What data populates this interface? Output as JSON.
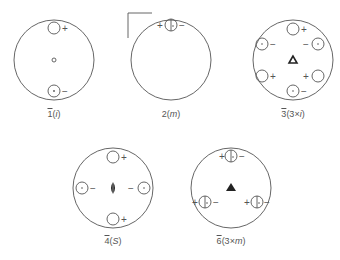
{
  "figure": {
    "line_color": "#555555",
    "panels": [
      {
        "id": "1bar",
        "label_bar": "1",
        "label_paren": "(",
        "label_sym": "i",
        "label_close": ")",
        "description": "1̄ (i): inversion center; pair of poles + (open) and − (dotted)"
      },
      {
        "id": "2bar",
        "label_bar": "",
        "label_plain": "2",
        "label_paren": "(",
        "label_sym": "m",
        "label_close": ")",
        "description": "2̄ (m): mirror plane; split pole +/− on the circle"
      },
      {
        "id": "3bar",
        "label_bar": "3",
        "label_paren": "(3×",
        "label_sym": "i",
        "label_close": ")",
        "description": "3̄ (3×i): six poles alternating + and −, open triangle at center"
      },
      {
        "id": "4bar",
        "label_bar": "4",
        "label_paren": "(",
        "label_sym": "S",
        "label_close": ")",
        "description": "4̄ (S): four poles, + top/bottom, − left/right, lens symbol at center"
      },
      {
        "id": "6bar",
        "label_bar": "6",
        "label_paren": "(3×",
        "label_sym": "m",
        "label_close": ")",
        "description": "6̄ (3×m): three split poles on the circle, filled triangle at center"
      }
    ],
    "signs": {
      "plus": "+",
      "minus": "−"
    }
  }
}
